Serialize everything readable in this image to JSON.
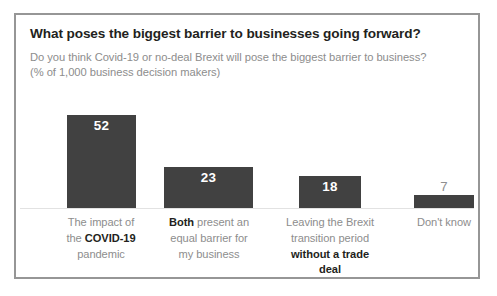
{
  "card": {
    "title": "What poses the biggest barrier to businesses going forward?",
    "subtitle_line1": "Do you think Covid-19 or no-deal Brexit will pose the biggest barrier to business?",
    "subtitle_line2": "(% of 1,000 business decision makers)"
  },
  "chart_data": {
    "type": "bar",
    "title": "What poses the biggest barrier to businesses going forward?",
    "subtitle": "Do you think Covid-19 or no-deal Brexit will pose the biggest barrier to business? (% of 1,000 business decision makers)",
    "xlabel": "",
    "ylabel": "% of 1,000 business decision makers",
    "ylim": [
      0,
      60
    ],
    "grid": false,
    "legend": false,
    "bar_color": "#414141",
    "value_label_inside_color": "#ffffff",
    "value_label_outside_color": "#8f8f8f",
    "categories": [
      "The impact of the COVID-19 pandemic",
      "Both present an equal barrier for my business",
      "Leaving the Brexit transition period without a trade deal",
      "Don't know"
    ],
    "values": [
      52,
      23,
      18,
      7
    ],
    "bars": [
      {
        "value": 52,
        "value_text": "52",
        "label_inside": true,
        "lines": [
          [
            {
              "t": "The impact of",
              "bold": false
            }
          ],
          [
            {
              "t": "the ",
              "bold": false
            },
            {
              "t": "COVID-19",
              "bold": true
            }
          ],
          [
            {
              "t": "pandemic",
              "bold": false
            }
          ]
        ]
      },
      {
        "value": 23,
        "value_text": "23",
        "label_inside": true,
        "lines": [
          [
            {
              "t": "Both",
              "bold": true
            },
            {
              "t": " present an",
              "bold": false
            }
          ],
          [
            {
              "t": "equal barrier for",
              "bold": false
            }
          ],
          [
            {
              "t": "my business",
              "bold": false
            }
          ]
        ]
      },
      {
        "value": 18,
        "value_text": "18",
        "label_inside": true,
        "lines": [
          [
            {
              "t": "Leaving the Brexit",
              "bold": false
            }
          ],
          [
            {
              "t": "transition period",
              "bold": false
            }
          ],
          [
            {
              "t": "without a trade deal",
              "bold": true
            }
          ]
        ]
      },
      {
        "value": 7,
        "value_text": "7",
        "label_inside": false,
        "lines": [
          [
            {
              "t": "Don't know",
              "bold": false
            }
          ]
        ]
      }
    ]
  },
  "geometry": {
    "bar_left": [
      51,
      148,
      283,
      398
    ],
    "bar_width": [
      69,
      89,
      62,
      60
    ],
    "label_left": [
      26,
      144,
      268,
      384
    ],
    "label_width": [
      118,
      98,
      92,
      88
    ],
    "px_per_unit": 1.79
  }
}
